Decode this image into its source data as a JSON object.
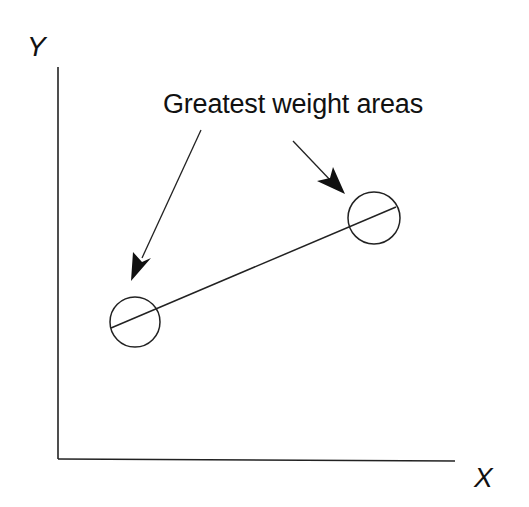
{
  "diagram": {
    "axes": {
      "y_label": "Y",
      "x_label": "X"
    },
    "annotation": {
      "text": "Greatest weight areas"
    },
    "elements": {
      "line": {
        "description": "straight line connecting two weighted regions"
      },
      "regions": [
        {
          "name": "left-weight-area",
          "shape": "circle"
        },
        {
          "name": "right-weight-area",
          "shape": "circle"
        }
      ],
      "arrows": [
        {
          "from": "annotation",
          "to": "left-weight-area"
        },
        {
          "from": "annotation",
          "to": "right-weight-area"
        }
      ]
    },
    "colors": {
      "ink": "#222222",
      "background": "#ffffff"
    }
  }
}
